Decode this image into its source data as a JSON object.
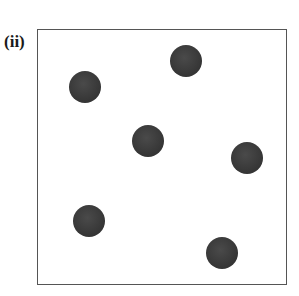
{
  "panel_label": "(ii)",
  "frame": {
    "left": 37,
    "top": 29,
    "width": 250,
    "height": 256,
    "border_color": "#555555"
  },
  "particles": [
    {
      "x": 85,
      "y": 87,
      "r": 16,
      "color": "#383838"
    },
    {
      "x": 186,
      "y": 61,
      "r": 16,
      "color": "#383838"
    },
    {
      "x": 148,
      "y": 141,
      "r": 16,
      "color": "#383838"
    },
    {
      "x": 247,
      "y": 158,
      "r": 16,
      "color": "#383838"
    },
    {
      "x": 89,
      "y": 221,
      "r": 16,
      "color": "#383838"
    },
    {
      "x": 222,
      "y": 253,
      "r": 16,
      "color": "#383838"
    }
  ]
}
